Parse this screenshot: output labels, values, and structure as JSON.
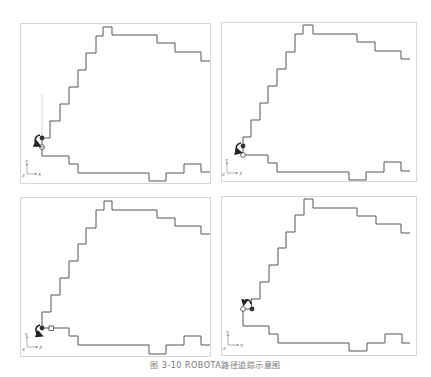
{
  "figure": {
    "caption": "图 3-10  ROBOTA路径追踪示意图",
    "stroke_color": "#555555",
    "frame_color": "#d6d6d6",
    "axis_labels": {
      "y": "Y",
      "x": "X",
      "z": "Z"
    },
    "panels": [
      {
        "id": "top-left",
        "frame": [
          20,
          23,
          191,
          161
        ]
      },
      {
        "id": "top-right",
        "frame": [
          221,
          22,
          196,
          160
        ]
      },
      {
        "id": "bottom-left",
        "frame": [
          20,
          197,
          191,
          160
        ]
      },
      {
        "id": "bottom-right",
        "frame": [
          221,
          196,
          196,
          160
        ]
      }
    ]
  }
}
